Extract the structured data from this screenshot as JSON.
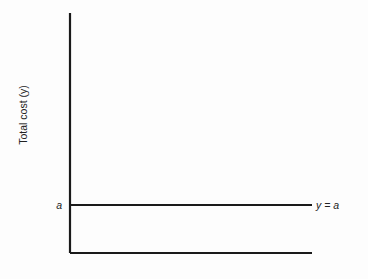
{
  "chart_data": {
    "type": "line",
    "title": "",
    "xlabel": "",
    "ylabel": "Total cost (y)",
    "ylim": [
      0,
      1
    ],
    "xlim": [
      0,
      1
    ],
    "grid": false,
    "y_ticks": [
      {
        "label": "a",
        "value": 0.2
      }
    ],
    "series": [
      {
        "name": "y = a",
        "x": [
          0,
          1
        ],
        "y": [
          0.2,
          0.2
        ],
        "label": "y = a"
      }
    ]
  }
}
